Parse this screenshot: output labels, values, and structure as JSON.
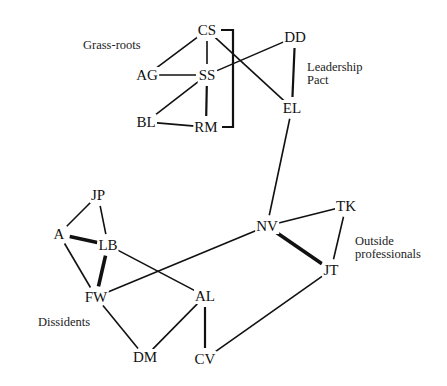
{
  "diagram": {
    "type": "social-network",
    "groups": [
      {
        "id": "grass_roots",
        "label": "Grass-roots",
        "x": 83,
        "y": 39
      },
      {
        "id": "leadership_pact",
        "label": "Leadership\nPact",
        "x": 307,
        "y": 61
      },
      {
        "id": "outside_professionals",
        "label": "Outside\nprofessionals",
        "x": 355,
        "y": 235
      },
      {
        "id": "dissidents",
        "label": "Dissidents",
        "x": 38,
        "y": 316
      }
    ],
    "nodes": [
      {
        "id": "CS",
        "label": "CS",
        "x": 207,
        "y": 30
      },
      {
        "id": "SS",
        "label": "SS",
        "x": 207,
        "y": 75
      },
      {
        "id": "AG",
        "label": "AG",
        "x": 147,
        "y": 75
      },
      {
        "id": "BL",
        "label": "BL",
        "x": 146,
        "y": 122
      },
      {
        "id": "RM",
        "label": "RM",
        "x": 206,
        "y": 127
      },
      {
        "id": "DD",
        "label": "DD",
        "x": 295,
        "y": 37
      },
      {
        "id": "EL",
        "label": "EL",
        "x": 292,
        "y": 108
      },
      {
        "id": "NV",
        "label": "NV",
        "x": 267,
        "y": 226
      },
      {
        "id": "TK",
        "label": "TK",
        "x": 346,
        "y": 206
      },
      {
        "id": "JT",
        "label": "JT",
        "x": 331,
        "y": 270
      },
      {
        "id": "JP",
        "label": "JP",
        "x": 98,
        "y": 195
      },
      {
        "id": "A",
        "label": "A",
        "x": 59,
        "y": 234
      },
      {
        "id": "LB",
        "label": "LB",
        "x": 108,
        "y": 245
      },
      {
        "id": "FW",
        "label": "FW",
        "x": 96,
        "y": 297
      },
      {
        "id": "AL",
        "label": "AL",
        "x": 205,
        "y": 296
      },
      {
        "id": "DM",
        "label": "DM",
        "x": 145,
        "y": 357
      },
      {
        "id": "CV",
        "label": "CV",
        "x": 205,
        "y": 359
      }
    ],
    "edges": [
      {
        "from": "CS",
        "to": "AG",
        "weight": "normal"
      },
      {
        "from": "CS",
        "to": "SS",
        "weight": "normal"
      },
      {
        "from": "CS",
        "to": "EL",
        "weight": "normal"
      },
      {
        "from": "AG",
        "to": "SS",
        "weight": "normal"
      },
      {
        "from": "SS",
        "to": "BL",
        "weight": "normal"
      },
      {
        "from": "SS",
        "to": "RM",
        "weight": "strong"
      },
      {
        "from": "SS",
        "to": "DD",
        "weight": "normal"
      },
      {
        "from": "BL",
        "to": "RM",
        "weight": "normal"
      },
      {
        "from": "CS",
        "to": "RM",
        "weight": "strong",
        "shape": "bracket"
      },
      {
        "from": "DD",
        "to": "EL",
        "weight": "strong"
      },
      {
        "from": "EL",
        "to": "NV",
        "weight": "normal"
      },
      {
        "from": "NV",
        "to": "TK",
        "weight": "normal"
      },
      {
        "from": "NV",
        "to": "JT",
        "weight": "heavy"
      },
      {
        "from": "TK",
        "to": "JT",
        "weight": "normal"
      },
      {
        "from": "NV",
        "to": "FW",
        "weight": "normal"
      },
      {
        "from": "JT",
        "to": "CV",
        "weight": "normal"
      },
      {
        "from": "JP",
        "to": "A",
        "weight": "normal"
      },
      {
        "from": "JP",
        "to": "LB",
        "weight": "normal"
      },
      {
        "from": "A",
        "to": "LB",
        "weight": "heavy"
      },
      {
        "from": "A",
        "to": "FW",
        "weight": "normal"
      },
      {
        "from": "LB",
        "to": "FW",
        "weight": "heavy"
      },
      {
        "from": "LB",
        "to": "AL",
        "weight": "normal"
      },
      {
        "from": "FW",
        "to": "DM",
        "weight": "normal"
      },
      {
        "from": "AL",
        "to": "DM",
        "weight": "normal"
      },
      {
        "from": "AL",
        "to": "CV",
        "weight": "strong"
      }
    ]
  }
}
